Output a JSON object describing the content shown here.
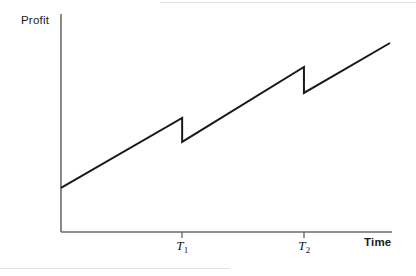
{
  "figure": {
    "width": 416,
    "height": 276,
    "background_color": "#ffffff",
    "line_color": "#1a1a1a",
    "axis_color": "#6b6b6b"
  },
  "labels": {
    "y_axis": "Profit",
    "x_axis": "Time",
    "tick_t1_base": "T",
    "tick_t1_sub": "1",
    "tick_t2_base": "T",
    "tick_t2_sub": "2"
  },
  "chart_data": {
    "type": "line",
    "title": "",
    "subtitle": "",
    "xlabel": "Time",
    "ylabel": "Profit",
    "grid": false,
    "legend": null,
    "axis_ranges": {
      "x": [
        0,
        1
      ],
      "y": [
        0,
        1
      ]
    },
    "tick_labels": {
      "x": [
        "T₁",
        "T₂"
      ],
      "y": []
    },
    "series": [
      {
        "name": "Profit",
        "points": [
          {
            "x": 0.0,
            "y": 0.202
          },
          {
            "x": 0.366,
            "y": 0.523
          },
          {
            "x": 0.366,
            "y": 0.413
          },
          {
            "x": 0.734,
            "y": 0.757
          },
          {
            "x": 0.734,
            "y": 0.638
          },
          {
            "x": 0.994,
            "y": 0.867
          }
        ]
      }
    ],
    "events": [
      {
        "label": "T₁",
        "x": 0.366,
        "type": "drop",
        "from_y": 0.523,
        "to_y": 0.413
      },
      {
        "label": "T₂",
        "x": 0.734,
        "type": "drop",
        "from_y": 0.757,
        "to_y": 0.638
      }
    ]
  }
}
